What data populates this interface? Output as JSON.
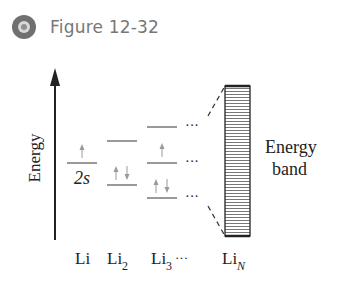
{
  "header": {
    "icon": "figure-disc-icon",
    "title": "Figure 12-32"
  },
  "diagram": {
    "axis_label": "Energy",
    "orbital_label": "2s",
    "band_label_line1": "Energy",
    "band_label_line2": "band",
    "ellipsis": "···",
    "columns": [
      {
        "label": "Li",
        "sub": ""
      },
      {
        "label": "Li",
        "sub": "2"
      },
      {
        "label": "Li",
        "sub": "3"
      },
      {
        "label": "···",
        "sub": ""
      },
      {
        "label": "Li",
        "sub": "N"
      }
    ]
  },
  "colors": {
    "line": "#333333",
    "arrow": "#9a9a9a",
    "title": "#777777"
  }
}
